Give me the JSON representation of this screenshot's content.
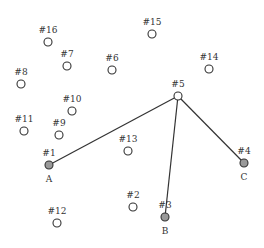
{
  "diagram": {
    "width": 264,
    "height": 248,
    "colors": {
      "edge": "#333333",
      "node_stroke": "#333333",
      "node_fill": "#ffffff",
      "terminal_fill": "#999999",
      "label": "#333333"
    },
    "nodes": [
      {
        "id": "1",
        "label": "#1",
        "x": 49,
        "y": 165,
        "terminal": true,
        "terminal_label": "A"
      },
      {
        "id": "2",
        "label": "#2",
        "x": 133,
        "y": 207,
        "terminal": false
      },
      {
        "id": "3",
        "label": "#3",
        "x": 165,
        "y": 217,
        "terminal": true,
        "terminal_label": "B"
      },
      {
        "id": "4",
        "label": "#4",
        "x": 244,
        "y": 163,
        "terminal": true,
        "terminal_label": "C"
      },
      {
        "id": "5",
        "label": "#5",
        "x": 178,
        "y": 96,
        "terminal": false
      },
      {
        "id": "6",
        "label": "#6",
        "x": 112,
        "y": 70,
        "terminal": false
      },
      {
        "id": "7",
        "label": "#7",
        "x": 67,
        "y": 66,
        "terminal": false
      },
      {
        "id": "8",
        "label": "#8",
        "x": 21,
        "y": 84,
        "terminal": false
      },
      {
        "id": "9",
        "label": "#9",
        "x": 59,
        "y": 135,
        "terminal": false
      },
      {
        "id": "10",
        "label": "#10",
        "x": 72,
        "y": 111,
        "terminal": false
      },
      {
        "id": "11",
        "label": "#11",
        "x": 24,
        "y": 131,
        "terminal": false
      },
      {
        "id": "12",
        "label": "#12",
        "x": 57,
        "y": 223,
        "terminal": false
      },
      {
        "id": "13",
        "label": "#13",
        "x": 128,
        "y": 151,
        "terminal": false
      },
      {
        "id": "14",
        "label": "#14",
        "x": 209,
        "y": 69,
        "terminal": false
      },
      {
        "id": "15",
        "label": "#15",
        "x": 152,
        "y": 34,
        "terminal": false
      },
      {
        "id": "16",
        "label": "#16",
        "x": 48,
        "y": 42,
        "terminal": false
      }
    ],
    "edges": [
      {
        "from": "5",
        "to": "1"
      },
      {
        "from": "5",
        "to": "3"
      },
      {
        "from": "5",
        "to": "4"
      }
    ]
  }
}
